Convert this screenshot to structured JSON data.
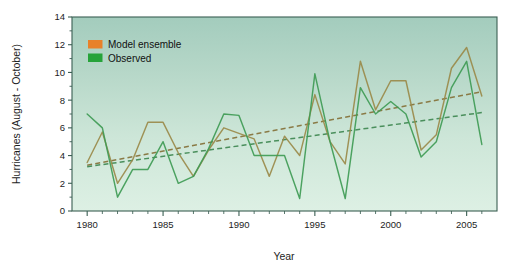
{
  "chart_data": {
    "type": "line",
    "title": "",
    "xlabel": "Year",
    "ylabel": "Hurricanes (August - October)",
    "xlim": [
      1979,
      2007
    ],
    "ylim": [
      0,
      14
    ],
    "xticks": [
      1980,
      1985,
      1990,
      1995,
      2000,
      2005
    ],
    "xtick_labels": [
      "1980",
      "1985",
      "1990",
      "1995",
      "2000",
      "2005"
    ],
    "yticks": [
      0,
      2,
      4,
      6,
      8,
      10,
      12,
      14
    ],
    "ytick_labels": [
      "0",
      "2",
      "4",
      "6",
      "8",
      "10",
      "12",
      "14"
    ],
    "x": [
      1980,
      1981,
      1982,
      1983,
      1984,
      1985,
      1986,
      1987,
      1988,
      1989,
      1990,
      1991,
      1992,
      1993,
      1994,
      1995,
      1996,
      1997,
      1998,
      1999,
      2000,
      2001,
      2002,
      2003,
      2004,
      2005,
      2006
    ],
    "grid": false,
    "legend_position": "top-left",
    "series": [
      {
        "name": "Model ensemble",
        "color": "#9a8a4a",
        "legend_swatch_color": "#e8812a",
        "style": "solid",
        "values": [
          3.5,
          5.7,
          2.0,
          3.7,
          6.4,
          6.4,
          4.2,
          2.5,
          4.4,
          6.0,
          5.6,
          5.2,
          2.5,
          5.4,
          4.0,
          8.4,
          5.0,
          3.4,
          10.8,
          7.3,
          9.4,
          9.4,
          4.4,
          5.5,
          10.3,
          11.8,
          8.3
        ]
      },
      {
        "name": "Observed",
        "color": "#3f9b55",
        "legend_swatch_color": "#26a33a",
        "style": "solid",
        "values": [
          7.0,
          6.0,
          1.0,
          3.0,
          3.0,
          5.0,
          2.0,
          2.5,
          4.5,
          7.0,
          6.9,
          4.0,
          4.0,
          4.0,
          0.9,
          9.9,
          5.0,
          0.9,
          8.9,
          7.0,
          7.9,
          7.0,
          3.9,
          5.0,
          8.9,
          10.8,
          4.8
        ]
      }
    ],
    "trendlines": [
      {
        "name": "Model ensemble trend",
        "color": "#8a7a45",
        "style": "dashed",
        "x0": 1980,
        "y0": 3.3,
        "x1": 2006,
        "y1": 8.6
      },
      {
        "name": "Observed trend",
        "color": "#4a8f5c",
        "style": "dashed",
        "x0": 1980,
        "y0": 3.2,
        "x1": 2006,
        "y1": 7.1
      }
    ],
    "plot_background_top": "#a8cfc0",
    "plot_background_bottom": "#dcefe2",
    "axis_color": "#3b5f53"
  },
  "legend": {
    "items": [
      {
        "label": "Model ensemble",
        "color": "#e8812a"
      },
      {
        "label": "Observed",
        "color": "#26a33a"
      }
    ]
  }
}
